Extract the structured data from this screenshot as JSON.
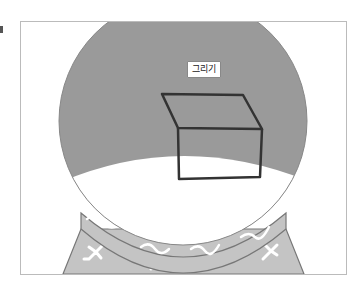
{
  "illustration": {
    "subject": "snow-globe",
    "label": "그리기",
    "colors": {
      "sky": "#9a9a9a",
      "snow": "#ffffff",
      "base": "#c4c4c4",
      "outline": "#777777",
      "box_stroke": "#333333"
    }
  }
}
